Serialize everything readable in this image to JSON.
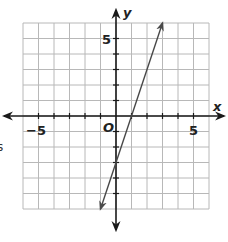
{
  "edge_fragment": "s",
  "chart_data": {
    "type": "line",
    "title": "",
    "xlabel": "x",
    "ylabel": "y",
    "origin_label": "O",
    "xlim": [
      -6,
      6
    ],
    "ylim": [
      -6,
      6
    ],
    "grid": true,
    "x_tick_labels": [
      {
        "value": -5,
        "label": "−5"
      },
      {
        "value": 5,
        "label": "5"
      }
    ],
    "y_tick_labels": [
      {
        "value": 5,
        "label": "5"
      }
    ],
    "series": [
      {
        "name": "line",
        "equation": "y = 3x - 3",
        "slope": 3,
        "intercept": -3,
        "x": [
          -1,
          0,
          1,
          2,
          3
        ],
        "y": [
          -6,
          -3,
          0,
          3,
          6
        ],
        "arrows_both_ends": true,
        "color": "#4a4a4a"
      }
    ],
    "colors": {
      "grid": "#b8b8b8",
      "axis": "#1a1a1a",
      "line": "#4a4a4a"
    }
  }
}
